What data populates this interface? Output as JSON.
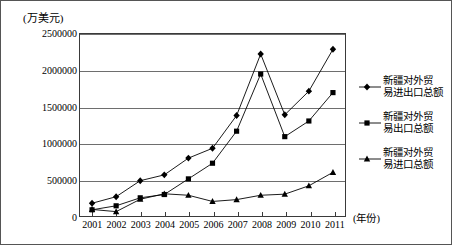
{
  "chart_data": {
    "type": "line",
    "title": "",
    "unit_label": "(万美元)",
    "xlabel": "(年份)",
    "ylabel": "",
    "categories": [
      "2001",
      "2002",
      "2003",
      "2004",
      "2005",
      "2006",
      "2007",
      "2008",
      "2009",
      "2010",
      "2011"
    ],
    "x": [
      2001,
      2002,
      2003,
      2004,
      2005,
      2006,
      2007,
      2008,
      2009,
      2010,
      2011
    ],
    "ylim": [
      0,
      2500000
    ],
    "yticks": [
      0,
      500000,
      1000000,
      1500000,
      2000000,
      2500000
    ],
    "ytick_labels": [
      "0",
      "500000",
      "1000000",
      "1500000",
      "2000000",
      "2500000"
    ],
    "grid": true,
    "legend_position": "right",
    "series": [
      {
        "name": "新疆对外贸易进出口总额",
        "marker": "diamond",
        "color": "#000000",
        "values": [
          175000,
          265000,
          485000,
          565000,
          795000,
          930000,
          1380000,
          2225000,
          1390000,
          1715000,
          2290000
        ]
      },
      {
        "name": "新疆对外贸易出口总额",
        "marker": "square",
        "color": "#000000",
        "values": [
          85000,
          140000,
          250000,
          295000,
          510000,
          725000,
          1165000,
          1950000,
          1090000,
          1305000,
          1695000
        ]
      },
      {
        "name": "新疆对外贸易进口总额",
        "marker": "triangle",
        "color": "#000000",
        "values": [
          90000,
          60000,
          230000,
          305000,
          285000,
          200000,
          225000,
          285000,
          300000,
          415000,
          600000
        ]
      }
    ]
  },
  "legend": {
    "items": [
      {
        "line1": "新疆对外贸",
        "line2": "易进出口总额",
        "marker": "diamond"
      },
      {
        "line1": "新疆对外贸",
        "line2": "易出口总额",
        "marker": "square"
      },
      {
        "line1": "新疆对外贸",
        "line2": "易进口总额",
        "marker": "triangle"
      }
    ]
  }
}
